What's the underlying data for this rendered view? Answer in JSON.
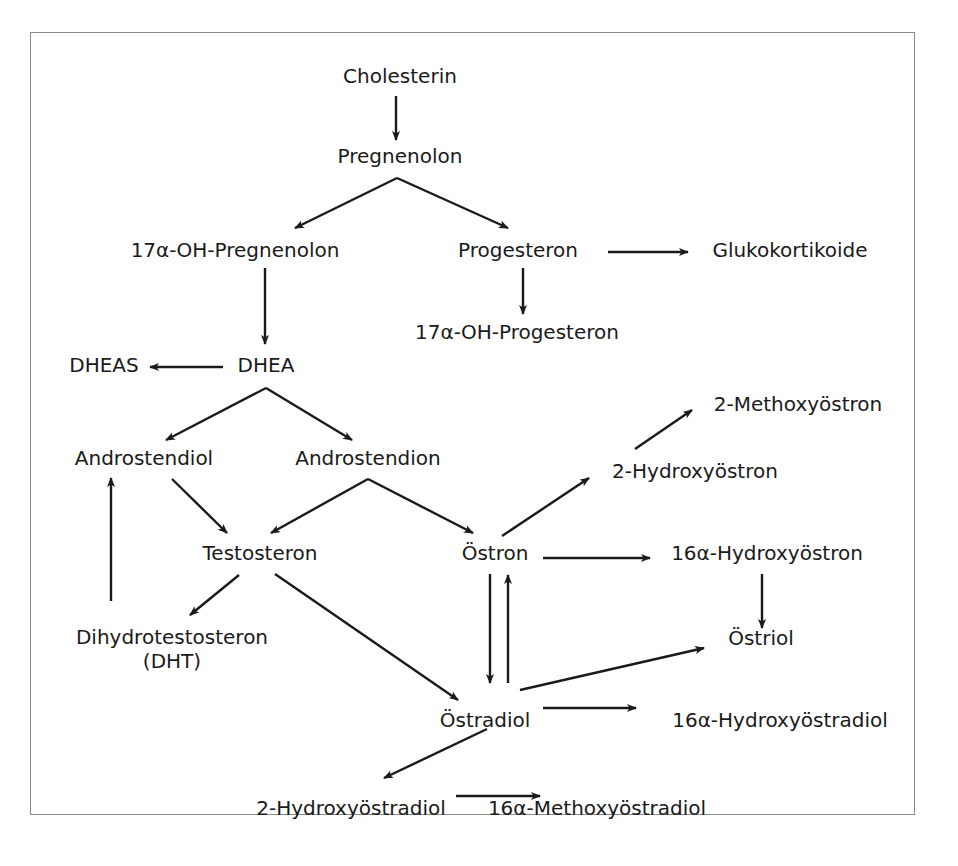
{
  "diagram": {
    "type": "flowchart",
    "title": "",
    "nodes": [
      {
        "id": "cholesterin",
        "label": "Cholesterin",
        "x": 400,
        "y": 64
      },
      {
        "id": "pregnenolon",
        "label": "Pregnenolon",
        "x": 400,
        "y": 144
      },
      {
        "id": "oh_pregnenolon",
        "label": "17α-OH-Pregnenolon",
        "x": 235,
        "y": 238
      },
      {
        "id": "progesteron",
        "label": "Progesteron",
        "x": 518,
        "y": 238
      },
      {
        "id": "glukokortikoide",
        "label": "Glukokortikoide",
        "x": 790,
        "y": 238
      },
      {
        "id": "oh_progesteron",
        "label": "17α-OH-Progesteron",
        "x": 517,
        "y": 320
      },
      {
        "id": "dheas",
        "label": "DHEAS",
        "x": 104,
        "y": 353
      },
      {
        "id": "dhea",
        "label": "DHEA",
        "x": 266,
        "y": 353
      },
      {
        "id": "methoxyoestron_2",
        "label": "2-Methoxyöstron",
        "x": 798,
        "y": 392
      },
      {
        "id": "androstendiol",
        "label": "Androstendiol",
        "x": 144,
        "y": 446
      },
      {
        "id": "androstendion",
        "label": "Androstendion",
        "x": 368,
        "y": 446
      },
      {
        "id": "hydroxyoestron_2",
        "label": "2-Hydroxyöstron",
        "x": 695,
        "y": 459
      },
      {
        "id": "testosteron",
        "label": "Testosteron",
        "x": 260,
        "y": 541
      },
      {
        "id": "oestron",
        "label": "Östron",
        "x": 495,
        "y": 541
      },
      {
        "id": "hydroxyoestron_16a",
        "label": "16α-Hydroxyöstron",
        "x": 767,
        "y": 541
      },
      {
        "id": "dht",
        "label": "Dihydrotestosteron\n(DHT)",
        "x": 172,
        "y": 625
      },
      {
        "id": "oestriol",
        "label": "Östriol",
        "x": 761,
        "y": 626
      },
      {
        "id": "oestradiol",
        "label": "Östradiol",
        "x": 485,
        "y": 708
      },
      {
        "id": "hydroxyoestradiol_16a",
        "label": "16α-Hydroxyöstradiol",
        "x": 780,
        "y": 708
      },
      {
        "id": "hydroxyoestradiol_2",
        "label": "2-Hydroxyöstradiol",
        "x": 351,
        "y": 796
      },
      {
        "id": "methoxyoestradiol_16a",
        "label": "16α-Methoxyöstradiol",
        "x": 597,
        "y": 796
      }
    ],
    "edges": [
      {
        "from": "cholesterin",
        "to": "pregnenolon",
        "x1": 396,
        "y1": 96,
        "x2": 396,
        "y2": 140
      },
      {
        "from": "pregnenolon",
        "to": "oh_pregnenolon",
        "x1": 397,
        "y1": 178,
        "x2": 295,
        "y2": 228
      },
      {
        "from": "pregnenolon",
        "to": "progesteron",
        "x1": 397,
        "y1": 178,
        "x2": 508,
        "y2": 228
      },
      {
        "from": "progesteron",
        "to": "glukokortikoide",
        "x1": 608,
        "y1": 252,
        "x2": 688,
        "y2": 252
      },
      {
        "from": "progesteron",
        "to": "oh_progesteron",
        "x1": 523,
        "y1": 268,
        "x2": 523,
        "y2": 314
      },
      {
        "from": "oh_pregnenolon",
        "to": "dhea",
        "x1": 265,
        "y1": 268,
        "x2": 265,
        "y2": 344
      },
      {
        "from": "dhea",
        "to": "dheas",
        "x1": 223,
        "y1": 367,
        "x2": 150,
        "y2": 367
      },
      {
        "from": "dhea",
        "to": "androstendiol",
        "x1": 266,
        "y1": 388,
        "x2": 166,
        "y2": 440
      },
      {
        "from": "dhea",
        "to": "androstendion",
        "x1": 266,
        "y1": 388,
        "x2": 352,
        "y2": 440
      },
      {
        "from": "androstendiol",
        "to": "testosteron",
        "x1": 172,
        "y1": 479,
        "x2": 227,
        "y2": 533
      },
      {
        "from": "androstendion",
        "to": "testosteron",
        "x1": 368,
        "y1": 479,
        "x2": 271,
        "y2": 533
      },
      {
        "from": "androstendion",
        "to": "oestron",
        "x1": 368,
        "y1": 479,
        "x2": 473,
        "y2": 533
      },
      {
        "from": "dht",
        "to": "androstendiol",
        "x1": 111,
        "y1": 601,
        "x2": 111,
        "y2": 478
      },
      {
        "from": "testosteron",
        "to": "dht",
        "x1": 239,
        "y1": 575,
        "x2": 190,
        "y2": 615
      },
      {
        "from": "testosteron",
        "to": "oestradiol",
        "x1": 275,
        "y1": 574,
        "x2": 458,
        "y2": 700
      },
      {
        "from": "oestron",
        "to": "hydroxyoestron_2",
        "x1": 502,
        "y1": 536,
        "x2": 589,
        "y2": 478
      },
      {
        "from": "hydroxyoestron_2",
        "to": "methoxyoestron_2",
        "x1": 635,
        "y1": 449,
        "x2": 692,
        "y2": 410
      },
      {
        "from": "oestron",
        "to": "hydroxyoestron_16a",
        "x1": 543,
        "y1": 558,
        "x2": 650,
        "y2": 558
      },
      {
        "from": "oestron",
        "to": "oestradiol",
        "x1": 490,
        "y1": 574,
        "x2": 490,
        "y2": 683
      },
      {
        "from": "oestradiol",
        "to": "oestron",
        "x1": 508,
        "y1": 683,
        "x2": 508,
        "y2": 575
      },
      {
        "from": "hydroxyoestron_16a",
        "to": "oestriol",
        "x1": 762,
        "y1": 574,
        "x2": 762,
        "y2": 628
      },
      {
        "from": "oestradiol",
        "to": "oestriol",
        "x1": 520,
        "y1": 690,
        "x2": 704,
        "y2": 648
      },
      {
        "from": "oestradiol",
        "to": "hydroxyoestradiol_16a",
        "x1": 543,
        "y1": 708,
        "x2": 636,
        "y2": 708
      },
      {
        "from": "oestradiol",
        "to": "hydroxyoestradiol_2",
        "x1": 487,
        "y1": 729,
        "x2": 384,
        "y2": 778
      },
      {
        "from": "hydroxyoestradiol_2",
        "to": "methoxyoestradiol_16a",
        "x1": 456,
        "y1": 796,
        "x2": 540,
        "y2": 796
      }
    ],
    "colors": {
      "text": "#1a1a1a",
      "line": "#1a1a1a",
      "frame": "#8a8a8a",
      "background": "#ffffff"
    }
  }
}
